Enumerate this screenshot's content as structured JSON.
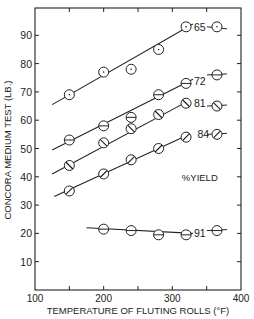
{
  "chart_data": {
    "type": "line",
    "title": "",
    "xlabel": "TEMPERATURE OF FLUTING ROLLS (°F)",
    "ylabel": "CONCORA MEDIUM TEST (LB.)",
    "xlim": [
      100,
      400
    ],
    "ylim": [
      0,
      100
    ],
    "xticks": [
      100,
      200,
      300,
      400
    ],
    "yticks": [
      10,
      20,
      30,
      40,
      50,
      60,
      70,
      80,
      90
    ],
    "grid": false,
    "legend_title": "%YIELD",
    "series": [
      {
        "name": "65",
        "marker": "circle-dot",
        "x": [
          150,
          200,
          240,
          280,
          320,
          365
        ],
        "y": [
          69,
          77,
          78,
          85,
          93,
          93
        ],
        "fit": [
          [
            125,
            65.5
          ],
          [
            330,
            94
          ]
        ]
      },
      {
        "name": "72",
        "marker": "circle-horizontal",
        "x": [
          150,
          200,
          240,
          280,
          320,
          365
        ],
        "y": [
          53,
          58,
          61,
          69,
          73,
          76
        ],
        "fit": [
          [
            125,
            49.5
          ],
          [
            330,
            74.5
          ]
        ]
      },
      {
        "name": "81",
        "marker": "circle-backslash",
        "x": [
          150,
          200,
          240,
          280,
          320,
          365
        ],
        "y": [
          44,
          52,
          57,
          62,
          66,
          65
        ],
        "fit": [
          [
            125,
            41
          ],
          [
            325,
            67
          ]
        ]
      },
      {
        "name": "84",
        "marker": "circle-slash",
        "x": [
          150,
          200,
          240,
          280,
          320,
          365
        ],
        "y": [
          35,
          41,
          46,
          50,
          54,
          55
        ],
        "fit": [
          [
            128,
            33
          ],
          [
            325,
            55
          ]
        ]
      },
      {
        "name": "91",
        "marker": "circle-horizontal",
        "x": [
          200,
          240,
          280,
          320,
          365
        ],
        "y": [
          21.5,
          21,
          19.5,
          19.5,
          21
        ],
        "fit": [
          [
            175,
            22
          ],
          [
            330,
            20
          ]
        ]
      }
    ],
    "annotations": [
      {
        "text": "65",
        "x": 340,
        "y": 93
      },
      {
        "text": "72",
        "x": 340,
        "y": 74
      },
      {
        "text": "81",
        "x": 340,
        "y": 66
      },
      {
        "text": "84",
        "x": 345,
        "y": 55
      },
      {
        "text": "%YIELD",
        "x": 340,
        "y": 40
      },
      {
        "text": "91",
        "x": 340,
        "y": 20
      }
    ]
  }
}
